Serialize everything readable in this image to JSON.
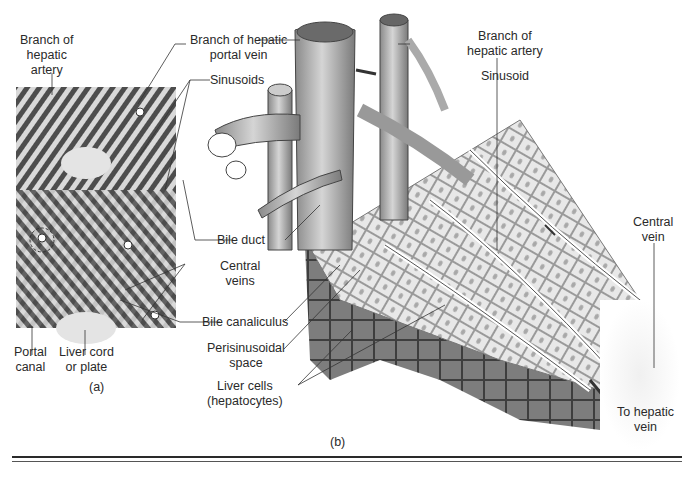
{
  "figure": {
    "panel_a": {
      "caption": "(a)",
      "labels": {
        "branch_hepatic_artery": [
          "Branch of",
          "hepatic",
          "artery"
        ],
        "portal_canal": [
          "Portal",
          "canal"
        ],
        "liver_cord": [
          "Liver cord",
          "or plate"
        ]
      }
    },
    "panel_b": {
      "caption": "(b)",
      "labels": {
        "branch_hepatic_portal_vein": [
          "Branch of hepatic",
          "portal vein"
        ],
        "sinusoids": "Sinusoids",
        "bile_duct": "Bile duct",
        "central_veins": [
          "Central",
          "veins"
        ],
        "bile_canaliculus": "Bile canaliculus",
        "perisinusoidal_space": [
          "Perisinusoidal",
          "space"
        ],
        "liver_cells": [
          "Liver cells",
          "(hepatocytes)"
        ],
        "branch_hepatic_artery": [
          "Branch of",
          "hepatic artery"
        ],
        "sinusoid": "Sinusoid",
        "central_vein": [
          "Central",
          "vein"
        ],
        "to_hepatic_vein": [
          "To hepatic",
          "vein"
        ]
      }
    },
    "colors": {
      "background": "#ffffff",
      "text": "#2a2a2a",
      "tissue_dark": "#4a4a4a",
      "tissue_light": "#d8d8d8",
      "cell_light": "#e6e6e6",
      "cell_dark": "#7a7a7a"
    }
  }
}
